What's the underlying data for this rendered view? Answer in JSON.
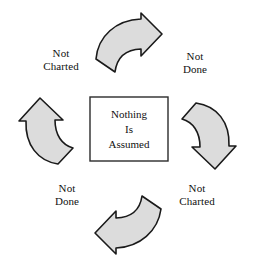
{
  "diagram": {
    "type": "circular-cycle",
    "background_color": "#ffffff",
    "arrow_fill_color": "#dcdcdc",
    "arrow_stroke_color": "#1a1a1a",
    "box_fill_color": "#ffffff",
    "box_stroke_color": "#2b2b2b",
    "text_color": "#111111"
  },
  "center_box": {
    "line1": "Nothing",
    "line2": "Is",
    "line3": "Assumed"
  },
  "labels": {
    "top_left": {
      "line1": "Not",
      "line2": "Charted"
    },
    "top_right": {
      "line1": "Not",
      "line2": "Done"
    },
    "bottom_left": {
      "line1": "Not",
      "line2": "Done"
    },
    "bottom_right": {
      "line1": "Not",
      "line2": "Charted"
    }
  },
  "arrows": [
    {
      "name": "top-arrow",
      "direction": "right",
      "position": "top"
    },
    {
      "name": "right-arrow",
      "direction": "down",
      "position": "right"
    },
    {
      "name": "bottom-arrow",
      "direction": "left",
      "position": "bottom"
    },
    {
      "name": "left-arrow",
      "direction": "up",
      "position": "left"
    }
  ]
}
